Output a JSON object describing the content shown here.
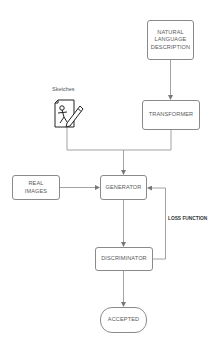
{
  "diagram": {
    "nodes": {
      "natural_language": {
        "label": "NATURAL\nLANGUAGE\nDESCRIPTION"
      },
      "transformer": {
        "label": "TRANSFORMER"
      },
      "sketches": {
        "label": "Sketches",
        "icon": "sketch-document-pencil-icon"
      },
      "real_images": {
        "label": "REAL\nIMAGES"
      },
      "generator": {
        "label": "GENERATOR"
      },
      "discriminator": {
        "label": "DISCRIMINATOR"
      },
      "accepted": {
        "label": "ACCEPTED"
      }
    },
    "edges": [
      {
        "from": "natural_language",
        "to": "transformer"
      },
      {
        "from": "transformer",
        "to": "generator"
      },
      {
        "from": "sketches",
        "to": "generator"
      },
      {
        "from": "real_images",
        "to": "generator"
      },
      {
        "from": "generator",
        "to": "discriminator"
      },
      {
        "from": "discriminator",
        "to": "generator",
        "label": "LOSS FUNCTION"
      },
      {
        "from": "discriminator",
        "to": "accepted"
      }
    ],
    "edge_labels": {
      "loss_function": "LOSS FUNCTION"
    },
    "colors": {
      "stroke": "#8a8a8a",
      "text": "#555555",
      "background": "#ffffff"
    }
  }
}
